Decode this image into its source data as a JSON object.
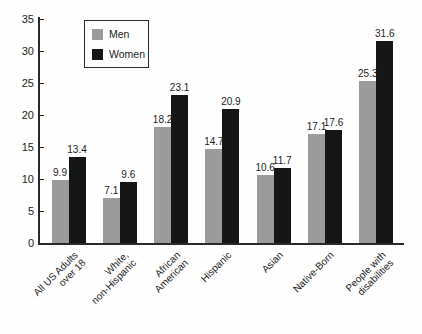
{
  "figure": {
    "background": "#fefefe",
    "axis_color": "#2a2a2a"
  },
  "chart_data": {
    "type": "bar",
    "title": "",
    "xlabel": "",
    "ylabel": "",
    "categories": [
      "All US Adults\nover 18",
      "White,\nnon-Hispanic",
      "African\nAmerican",
      "Hispanic",
      "Asian",
      "Native-Born",
      "People with\ndisabilities"
    ],
    "series": [
      {
        "name": "Men",
        "color": "#9b9b9b",
        "values": [
          9.9,
          7.1,
          18.2,
          14.7,
          10.6,
          17.1,
          25.3
        ]
      },
      {
        "name": "Women",
        "color": "#161616",
        "values": [
          13.4,
          9.6,
          23.1,
          20.9,
          11.7,
          17.6,
          31.6
        ]
      }
    ],
    "ylim": [
      0,
      35
    ],
    "yticks": [
      0,
      5,
      10,
      15,
      20,
      25,
      30,
      35
    ],
    "grid": false,
    "legend_position": "upper-left-inside",
    "value_labels": true,
    "bar_orientation": "vertical"
  }
}
